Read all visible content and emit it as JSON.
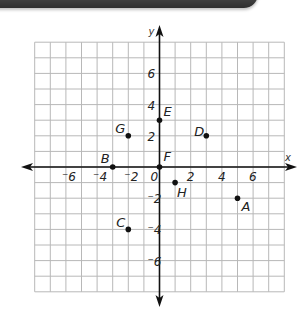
{
  "chart_data": {
    "type": "scatter",
    "title": "",
    "xlabel": "x",
    "ylabel": "y",
    "xlim": [
      -8,
      8
    ],
    "ylim": [
      -8,
      8
    ],
    "grid": true,
    "x_ticks": [
      {
        "value": -6,
        "label": "-6"
      },
      {
        "value": -4,
        "label": "-4"
      },
      {
        "value": -2,
        "label": "-2"
      },
      {
        "value": 0,
        "label": "0"
      },
      {
        "value": 2,
        "label": "2"
      },
      {
        "value": 4,
        "label": "4"
      },
      {
        "value": 6,
        "label": "6"
      }
    ],
    "y_ticks": [
      {
        "value": 6,
        "label": "6"
      },
      {
        "value": 4,
        "label": "4"
      },
      {
        "value": 2,
        "label": "2"
      },
      {
        "value": -2,
        "label": "-2"
      },
      {
        "value": -4,
        "label": "-4"
      },
      {
        "value": -6,
        "label": "-6"
      }
    ],
    "points": [
      {
        "label": "A",
        "x": 5,
        "y": -2,
        "label_dx": 4,
        "label_dy": 13
      },
      {
        "label": "B",
        "x": -3,
        "y": 0,
        "label_dx": -12,
        "label_dy": -4
      },
      {
        "label": "C",
        "x": -2,
        "y": -4,
        "label_dx": -12,
        "label_dy": -2
      },
      {
        "label": "D",
        "x": 3,
        "y": 2,
        "label_dx": -12,
        "label_dy": 0
      },
      {
        "label": "E",
        "x": 0,
        "y": 3,
        "label_dx": 4,
        "label_dy": -4
      },
      {
        "label": "F",
        "x": 0,
        "y": 0,
        "label_dx": 4,
        "label_dy": -6
      },
      {
        "label": "G",
        "x": -2,
        "y": 2,
        "label_dx": -13,
        "label_dy": -3
      },
      {
        "label": "H",
        "x": 1,
        "y": -1,
        "label_dx": 2,
        "label_dy": 14
      }
    ]
  },
  "banner": {
    "color": "#3a3a3a"
  }
}
